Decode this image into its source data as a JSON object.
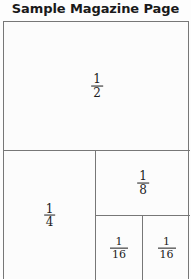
{
  "figure": {
    "title": "Sample Magazine Page",
    "outline_color": "#777777",
    "text_color": "#1c1c1c",
    "background_color": "#fcfcfc"
  },
  "cells": [
    {
      "name": "half-page",
      "label": "1/2",
      "numerator": "1",
      "denominator": "2"
    },
    {
      "name": "quarter-page",
      "label": "1/4",
      "numerator": "1",
      "denominator": "4"
    },
    {
      "name": "eighth-page",
      "label": "1/8",
      "numerator": "1",
      "denominator": "8"
    },
    {
      "name": "sixteenth-page-left",
      "label": "1/16",
      "numerator": "1",
      "denominator": "16"
    },
    {
      "name": "sixteenth-page-right",
      "label": "1/16",
      "numerator": "1",
      "denominator": "16"
    }
  ]
}
